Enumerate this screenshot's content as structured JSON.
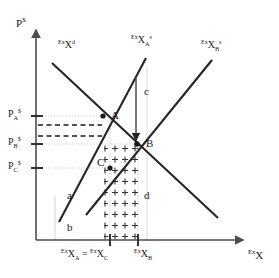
{
  "figure": {
    "type": "economics-supply-demand-diagram",
    "colors": {
      "curve": "#262626",
      "axis": "#4d4d4d",
      "guide": "#b3b3b3",
      "dashed": "#1a1a1a",
      "text": "#1a1a1a",
      "background": "#ffffff"
    }
  },
  "axes": {
    "y_title_base": "P",
    "y_title_sup": "$",
    "x_title_pre": "Ex",
    "x_title_base": "X"
  },
  "curves": [
    {
      "id": "demand",
      "label_pre": "Ex",
      "label_base": "X",
      "label_sup": "d",
      "slope": "downward",
      "label_x": 58,
      "label_y": 46
    },
    {
      "id": "supply-a",
      "label_pre": "Ex",
      "label_base": "X",
      "label_sub": "A",
      "label_sup": "s",
      "slope": "upward",
      "label_x": 131,
      "label_y": 41
    },
    {
      "id": "supply-b",
      "label_pre": "Ex",
      "label_base": "X",
      "label_sub": "B",
      "label_sup": "s",
      "slope": "upward",
      "label_x": 203,
      "label_y": 46
    }
  ],
  "price_ticks": [
    {
      "id": "p-a",
      "base": "P",
      "sub": "A",
      "sup": "$",
      "y": 116
    },
    {
      "id": "p-b",
      "base": "P",
      "sub": "B",
      "sup": "$",
      "y": 144
    },
    {
      "id": "p-c",
      "base": "P",
      "sub": "C",
      "sup": "$",
      "y": 168
    }
  ],
  "quantity_ticks": {
    "left_pre": "Ex",
    "left_base": "X",
    "left_sub": "A",
    "equals": "=",
    "mid_pre": "Ex",
    "mid_base": "X",
    "mid_sub": "C",
    "right_pre": "Ex",
    "right_base": "X",
    "right_sub": "B",
    "left_x": 110,
    "right_x": 138
  },
  "points": [
    {
      "id": "point-a",
      "label": "A",
      "x": 103,
      "y": 116
    },
    {
      "id": "point-b",
      "label": "B",
      "x": 137,
      "y": 144
    },
    {
      "id": "point-c",
      "label": "C",
      "x": 110,
      "y": 168
    }
  ],
  "area_labels": [
    {
      "id": "area-a",
      "label": "a",
      "x": 70,
      "y": 196
    },
    {
      "id": "area-b",
      "label": "b",
      "x": 70,
      "y": 228
    },
    {
      "id": "area-c",
      "label": "c",
      "x": 147,
      "y": 92
    },
    {
      "id": "area-d",
      "label": "d",
      "x": 147,
      "y": 196
    }
  ],
  "annotations": {
    "shift_arrow": {
      "id": "shift-arrow",
      "from_y": 78,
      "to_y": 140,
      "x": 136
    },
    "dashed_lines": [
      {
        "y": 125
      },
      {
        "y": 136
      }
    ],
    "hatch_fill": "plus-signs"
  }
}
